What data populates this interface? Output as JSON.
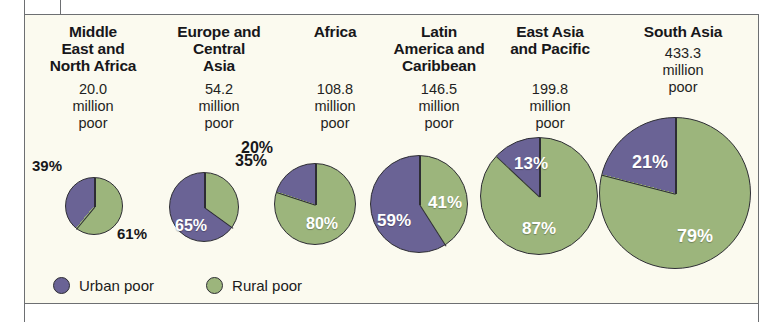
{
  "figure": {
    "background": "#fbfaef",
    "border_color": "#6d6f72"
  },
  "colors": {
    "urban": "#6a6395",
    "rural": "#9cb57c",
    "outline": "#2d2d33",
    "text": "#17171a",
    "inside_label": "#ffffff"
  },
  "legend": {
    "items": [
      {
        "label": "Urban poor",
        "color": "#6a6395",
        "key": "urban"
      },
      {
        "label": "Rural poor",
        "color": "#9cb57c",
        "key": "rural"
      }
    ]
  },
  "chart_data": {
    "type": "pie",
    "title": "",
    "subtitle": "",
    "xlabel": "",
    "ylabel": "",
    "legend_position": "bottom-left",
    "grid": false,
    "note": "Six pie charts, one per region. Slice sizes share a common scale: pie diameter is proportional to the total number of poor. Purple = urban poor share, green = rural poor share.",
    "slice_labels": [
      "Urban poor",
      "Rural poor"
    ],
    "regions": [
      {
        "name": "Middle East and\nNorth Africa",
        "title_lines": [
          "Middle",
          "East and",
          "North Africa"
        ],
        "total_million_poor": 20.0,
        "amount_lines": [
          "20.0",
          "million",
          "poor"
        ],
        "urban_pct": 39,
        "rural_pct": 61,
        "urban_label": "39%",
        "rural_label": "61%"
      },
      {
        "name": "Europe and Central Asia",
        "title_lines": [
          "Europe and",
          "Central",
          "Asia"
        ],
        "total_million_poor": 54.2,
        "amount_lines": [
          "54.2",
          "million",
          "poor"
        ],
        "urban_pct": 65,
        "rural_pct": 35,
        "urban_label": "65%",
        "rural_label": "35%"
      },
      {
        "name": "Africa",
        "title_lines": [
          "Africa"
        ],
        "total_million_poor": 108.8,
        "amount_lines": [
          "108.8",
          "million",
          "poor"
        ],
        "urban_pct": 20,
        "rural_pct": 80,
        "urban_label": "20%",
        "rural_label": "80%"
      },
      {
        "name": "Latin America and Caribbean",
        "title_lines": [
          "Latin",
          "America and",
          "Caribbean"
        ],
        "total_million_poor": 146.5,
        "amount_lines": [
          "146.5",
          "million",
          "poor"
        ],
        "urban_pct": 59,
        "rural_pct": 41,
        "urban_label": "59%",
        "rural_label": "41%"
      },
      {
        "name": "East Asia and Pacific",
        "title_lines": [
          "East Asia",
          "and Pacific"
        ],
        "total_million_poor": 199.8,
        "amount_lines": [
          "199.8",
          "million",
          "poor"
        ],
        "urban_pct": 13,
        "rural_pct": 87,
        "urban_label": "13%",
        "rural_label": "87%"
      },
      {
        "name": "South Asia",
        "title_lines": [
          "South Asia"
        ],
        "total_million_poor": 433.3,
        "amount_lines": [
          "433.3",
          "million",
          "poor"
        ],
        "urban_pct": 21,
        "rural_pct": 79,
        "urban_label": "21%",
        "rural_label": "79%"
      }
    ]
  },
  "columns": [
    {
      "title_line1": "Middle",
      "title_line2": "East and",
      "title_line3": "North Africa",
      "amount_line1": "20.0",
      "amount_line2": "million",
      "amount_line3": "poor",
      "urban_label": "39%",
      "rural_label": "61%"
    },
    {
      "title_line1": "Europe and",
      "title_line2": "Central",
      "title_line3": "Asia",
      "amount_line1": "54.2",
      "amount_line2": "million",
      "amount_line3": "poor",
      "urban_label": "65%",
      "rural_label": "35%"
    },
    {
      "title_line1": "Africa",
      "title_line2": "",
      "title_line3": "",
      "amount_line1": "108.8",
      "amount_line2": "million",
      "amount_line3": "poor",
      "urban_label": "20%",
      "rural_label": "80%"
    },
    {
      "title_line1": "Latin",
      "title_line2": "America and",
      "title_line3": "Caribbean",
      "amount_line1": "146.5",
      "amount_line2": "million",
      "amount_line3": "poor",
      "urban_label": "59%",
      "rural_label": "41%"
    },
    {
      "title_line1": "East Asia",
      "title_line2": "and Pacific",
      "title_line3": "",
      "amount_line1": "199.8",
      "amount_line2": "million",
      "amount_line3": "poor",
      "urban_label": "13%",
      "rural_label": "87%"
    },
    {
      "title_line1": "South Asia",
      "title_line2": "",
      "title_line3": "",
      "amount_line1": "433.3",
      "amount_line2": "million",
      "amount_line3": "poor",
      "urban_label": "21%",
      "rural_label": "79%"
    }
  ]
}
